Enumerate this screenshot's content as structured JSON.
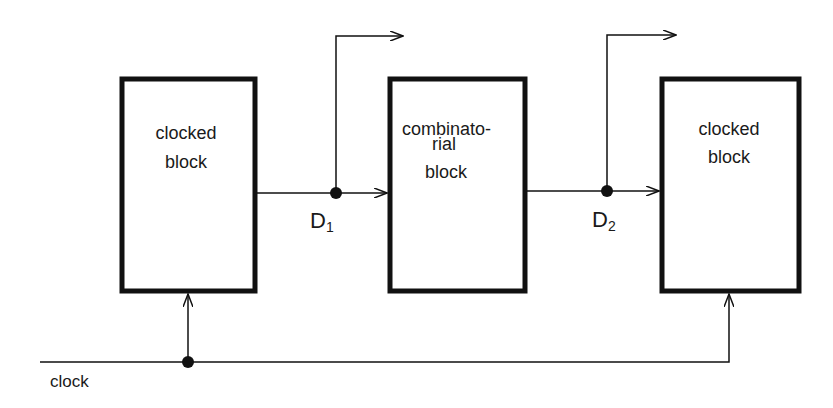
{
  "diagram": {
    "blocks": [
      {
        "id": "left",
        "lines": [
          "clocked",
          "block"
        ]
      },
      {
        "id": "middle",
        "lines": [
          "combinato-",
          "rial",
          "block"
        ]
      },
      {
        "id": "right",
        "lines": [
          "clocked",
          "block"
        ]
      }
    ],
    "nodes": {
      "d1": {
        "label": "D",
        "sub": "1"
      },
      "d2": {
        "label": "D",
        "sub": "2"
      }
    },
    "clock": {
      "label": "clock"
    },
    "colors": {
      "stroke": "#111111",
      "background": "#ffffff"
    }
  }
}
